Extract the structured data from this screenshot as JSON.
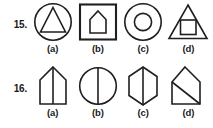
{
  "page": {
    "type": "geometry-figures-worksheet",
    "background_color": "#ffffff",
    "ink_color": "#1f1f1f"
  },
  "questions": [
    {
      "number": "15.",
      "options": [
        {
          "label": "(a)",
          "figure": "circle-with-inscribed-triangle"
        },
        {
          "label": "(b)",
          "figure": "square-with-inscribed-pentagon-house"
        },
        {
          "label": "(c)",
          "figure": "circle-with-inscribed-circle"
        },
        {
          "label": "(d)",
          "figure": "triangle-with-inscribed-square"
        }
      ]
    },
    {
      "number": "16.",
      "options": [
        {
          "label": "(a)",
          "figure": "pentagon-house-with-vertical-line"
        },
        {
          "label": "(b)",
          "figure": "circle-with-vertical-diameter"
        },
        {
          "label": "(c)",
          "figure": "hexagon-with-vertical-line"
        },
        {
          "label": "(d)",
          "figure": "pentagon-house-with-diagonal-line"
        }
      ]
    }
  ]
}
